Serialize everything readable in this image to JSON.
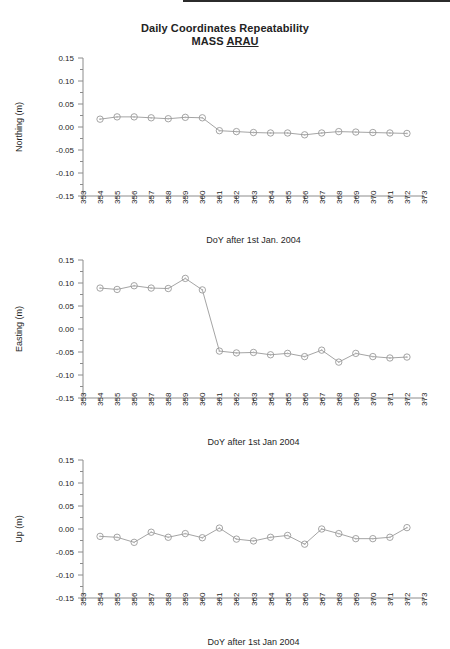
{
  "figure": {
    "title_line1": "Daily Coordinates Repeatability",
    "title_line2_prefix": "MASS ",
    "title_line2_station": "ARAU"
  },
  "chart_data": [
    {
      "type": "line",
      "panel": "northing",
      "title": "Daily Coordinates Repeatability MASS ARAU",
      "xlabel": "DoY after 1st Jan. 2004",
      "ylabel": "Northing (m)",
      "xlim": [
        353,
        373
      ],
      "ylim": [
        -0.15,
        0.15
      ],
      "xticks": [
        353,
        354,
        355,
        356,
        357,
        358,
        359,
        360,
        361,
        362,
        363,
        364,
        365,
        366,
        367,
        368,
        369,
        370,
        371,
        372,
        373
      ],
      "yticks": [
        0.15,
        0.1,
        0.05,
        0.0,
        -0.05,
        -0.1,
        -0.15
      ],
      "ytick_labels": [
        "0.15",
        "0.10",
        "0.05",
        "0.00",
        "-0.05",
        "-0.10",
        "-0.15"
      ],
      "grid": false,
      "legend": null,
      "marker": "circle-dot",
      "x": [
        354,
        355,
        356,
        357,
        358,
        359,
        360,
        361,
        362,
        363,
        364,
        365,
        366,
        367,
        368,
        369,
        370,
        371,
        372
      ],
      "values": [
        0.017,
        0.022,
        0.022,
        0.02,
        0.018,
        0.021,
        0.02,
        -0.008,
        -0.01,
        -0.012,
        -0.013,
        -0.013,
        -0.017,
        -0.013,
        -0.01,
        -0.011,
        -0.012,
        -0.013,
        -0.014
      ]
    },
    {
      "type": "line",
      "panel": "easting",
      "xlabel": "DoY after 1st  Jan 2004",
      "ylabel": "Easting (m)",
      "xlim": [
        353,
        373
      ],
      "ylim": [
        -0.15,
        0.15
      ],
      "xticks": [
        353,
        354,
        355,
        356,
        357,
        358,
        359,
        360,
        361,
        362,
        363,
        364,
        365,
        366,
        367,
        368,
        369,
        370,
        371,
        372,
        373
      ],
      "yticks": [
        0.15,
        0.1,
        0.05,
        0.0,
        -0.05,
        -0.1,
        -0.15
      ],
      "ytick_labels": [
        "0.15",
        "0.10",
        "0.05",
        "0.00",
        "-0.05",
        "-0.10",
        "-0.15"
      ],
      "grid": false,
      "legend": null,
      "marker": "circle-dot",
      "x": [
        354,
        355,
        356,
        357,
        358,
        359,
        360,
        361,
        362,
        363,
        364,
        365,
        366,
        367,
        368,
        369,
        370,
        371,
        372
      ],
      "values": [
        0.089,
        0.086,
        0.094,
        0.089,
        0.088,
        0.11,
        0.085,
        -0.048,
        -0.052,
        -0.051,
        -0.056,
        -0.053,
        -0.06,
        -0.046,
        -0.072,
        -0.053,
        -0.06,
        -0.063,
        -0.061
      ]
    },
    {
      "type": "line",
      "panel": "up",
      "xlabel": "DoY after  1st  Jan 2004",
      "ylabel": "Up (m)",
      "xlim": [
        353,
        373
      ],
      "ylim": [
        -0.15,
        0.15
      ],
      "xticks": [
        353,
        354,
        355,
        356,
        357,
        358,
        359,
        360,
        361,
        362,
        363,
        364,
        365,
        366,
        367,
        368,
        369,
        370,
        371,
        372,
        373
      ],
      "yticks": [
        0.15,
        0.1,
        0.05,
        0.0,
        -0.05,
        -0.1,
        -0.15
      ],
      "ytick_labels": [
        "0.15",
        "0.10",
        "0.05",
        "0.00",
        "-0.05",
        "-0.10",
        "-0.15"
      ],
      "grid": false,
      "legend": null,
      "marker": "circle-dot",
      "x": [
        354,
        355,
        356,
        357,
        358,
        359,
        360,
        361,
        362,
        363,
        364,
        365,
        366,
        367,
        368,
        369,
        370,
        371,
        372
      ],
      "values": [
        -0.016,
        -0.018,
        -0.029,
        -0.007,
        -0.018,
        -0.01,
        -0.019,
        0.002,
        -0.022,
        -0.026,
        -0.018,
        -0.014,
        -0.033,
        0.0,
        -0.01,
        -0.021,
        -0.021,
        -0.018,
        0.003
      ]
    }
  ]
}
